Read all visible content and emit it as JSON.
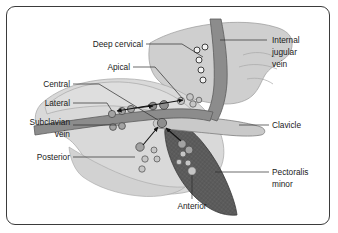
{
  "figure": {
    "frame_color": "#3b3b3b",
    "background_color": "#ffffff"
  },
  "labels": {
    "deep_cervical": "Deep cervical",
    "apical": "Apical",
    "central": "Central",
    "lateral": "Lateral",
    "subclavian_vein_line1": "Subclavian",
    "subclavian_vein_line2": "vein",
    "posterior": "Posterior",
    "anterior": "Anterior",
    "internal_jugular_line1": "Internal",
    "internal_jugular_line2": "jugular",
    "internal_jugular_line3": "vein",
    "clavicle": "Clavicle",
    "pectoralis_line1": "Pectoralis",
    "pectoralis_line2": "minor"
  },
  "structures": {
    "body_tissue_color": "#d9d9d9",
    "neck_tissue_color": "#cfcfcf",
    "vein_color": "#8c8c8c",
    "clavicle_color": "#c9c9c9",
    "pectoralis_minor_color": "#5b5b5b",
    "shoulder_color": "#dedede"
  },
  "node_groups": [
    {
      "name": "deep-cervical",
      "style": "open",
      "count": 5
    },
    {
      "name": "apical",
      "style": "light",
      "count": 4
    },
    {
      "name": "lateral",
      "style": "mid",
      "count": 6
    },
    {
      "name": "central",
      "style": "dark",
      "count": 1
    },
    {
      "name": "posterior",
      "style": "mid",
      "count": 5
    },
    {
      "name": "anterior",
      "style": "mid",
      "count": 6
    }
  ],
  "flow_arrows": {
    "lateral_to_apical": "bidirectional",
    "posterior_to_central": "toward-central",
    "anterior_to_central": "toward-central"
  }
}
